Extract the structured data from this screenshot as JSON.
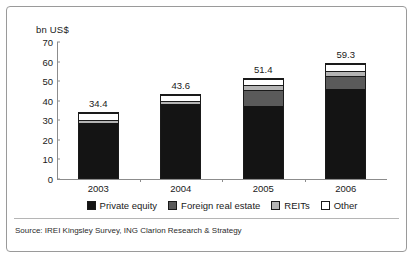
{
  "chart_data": {
    "type": "bar",
    "subtype": "stacked-vertical",
    "title": "",
    "xlabel": "",
    "ylabel": "bn US$",
    "ylim": [
      0,
      70
    ],
    "yticks": [
      0,
      10,
      20,
      30,
      40,
      50,
      60,
      70
    ],
    "ytick_labels": [
      "0",
      "10",
      "20",
      "30",
      "40",
      "50",
      "60",
      "70"
    ],
    "grid": false,
    "legend_position": "bottom",
    "categories": [
      "2003",
      "2004",
      "2005",
      "2006"
    ],
    "series": [
      {
        "name": "Private equity",
        "color": "#141414",
        "values": [
          29.0,
          38.5,
          37.5,
          46.5
        ]
      },
      {
        "name": "Foreign real estate",
        "color": "#5a5a5a",
        "values": [
          0.0,
          0.0,
          8.5,
          6.5
        ]
      },
      {
        "name": "REITs",
        "color": "#b4b4b4",
        "values": [
          1.4,
          1.6,
          2.4,
          2.8
        ]
      },
      {
        "name": "Other",
        "color": "#ffffff",
        "values": [
          4.0,
          3.5,
          3.0,
          3.5
        ]
      }
    ],
    "totals": [
      34.4,
      43.6,
      51.4,
      59.3
    ],
    "total_labels": [
      "34.4",
      "43.6",
      "51.4",
      "59.3"
    ]
  },
  "source": {
    "text": "Source: IREI Kingsley Survey, ING Clarion Research & Strategy"
  },
  "colors": {
    "private_equity": "#141414",
    "foreign_real_estate": "#5a5a5a",
    "reits": "#b4b4b4",
    "other": "#ffffff",
    "axis": "#8c8c8c",
    "text": "#1a1a1a",
    "frame": "#9a9a9a"
  }
}
